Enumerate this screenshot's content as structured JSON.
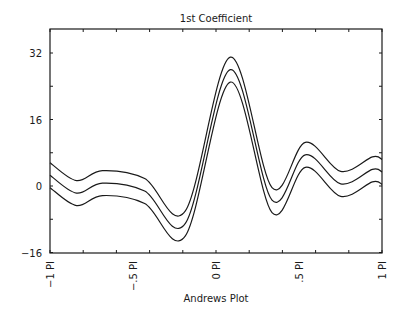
{
  "chart_data": {
    "type": "line",
    "title": "1st Coefficient",
    "xlabel": "Andrews Plot",
    "ylabel": "",
    "xlim": [
      -3.14159,
      3.14159
    ],
    "ylim": [
      -16,
      38
    ],
    "x_tick_labels": [
      "−1 PI",
      "−.5 PI",
      "0 PI",
      ".5 PI",
      "1 PI"
    ],
    "x_tick_values": [
      -3.14159,
      -1.5708,
      0,
      1.5708,
      3.14159
    ],
    "y_tick_labels": [
      "32",
      "16",
      "0",
      "−16"
    ],
    "y_tick_values": [
      32,
      16,
      0,
      -16
    ],
    "grid": false,
    "legend": null,
    "x": [
      -3.14159,
      -2.64,
      -2.15,
      -1.35,
      -0.58,
      0.27,
      1.06,
      1.69,
      2.36,
      2.96,
      3.14159
    ],
    "series": [
      {
        "name": "upper",
        "values": [
          5.6,
          1.3,
          3.7,
          1.8,
          -6.0,
          31.0,
          -0.4,
          10.5,
          3.5,
          7.0,
          6.4
        ]
      },
      {
        "name": "middle",
        "values": [
          2.6,
          -1.7,
          0.7,
          -1.2,
          -9.0,
          28.0,
          -3.4,
          7.5,
          0.5,
          4.0,
          3.4
        ]
      },
      {
        "name": "lower",
        "values": [
          -0.4,
          -4.7,
          -2.3,
          -4.2,
          -12.0,
          25.0,
          -6.4,
          4.5,
          -2.5,
          1.0,
          0.4
        ]
      }
    ]
  }
}
